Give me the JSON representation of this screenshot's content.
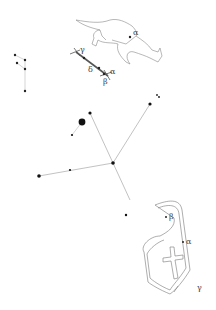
{
  "map": {
    "type": "star-chart",
    "constellations": [
      {
        "name": "fox",
        "labels": {
          "alpha": "α"
        }
      },
      {
        "name": "arrow",
        "labels": {
          "alpha": "α",
          "beta": "β",
          "gamma": "γ",
          "delta": "δ"
        }
      },
      {
        "name": "cross",
        "labels": {}
      },
      {
        "name": "shield",
        "labels": {
          "alpha": "α",
          "beta": "β",
          "gamma": "γ"
        }
      }
    ]
  }
}
